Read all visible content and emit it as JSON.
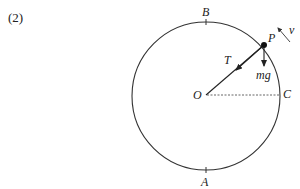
{
  "problem_number": "(2)",
  "diagram": {
    "points": {
      "top": "B",
      "bottom": "A",
      "right": "C",
      "center": "O",
      "particle": "P"
    },
    "forces": {
      "tension": "T",
      "weight": "mg"
    },
    "velocity": "v"
  }
}
